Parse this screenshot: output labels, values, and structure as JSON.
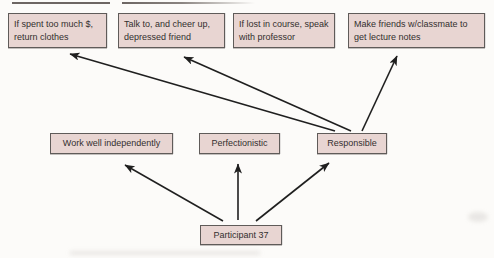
{
  "figure": {
    "participant": {
      "label": "Participant 37"
    },
    "traits": [
      {
        "label": "Work well independently"
      },
      {
        "label": "Perfectionistic"
      },
      {
        "label": "Responsible"
      }
    ],
    "behaviors": [
      {
        "label": "If spent too much $, return clothes"
      },
      {
        "label": "Talk to, and cheer up, depressed friend"
      },
      {
        "label": "If lost in course, speak with professor"
      },
      {
        "label": "Make friends w/classmate to get lecture notes"
      }
    ],
    "edges": [
      {
        "from": "Participant 37",
        "to": "Work well independently"
      },
      {
        "from": "Participant 37",
        "to": "Perfectionistic"
      },
      {
        "from": "Participant 37",
        "to": "Responsible"
      },
      {
        "from": "Responsible",
        "to": "If spent too much $, return clothes"
      },
      {
        "from": "Responsible",
        "to": "Talk to, and cheer up, depressed friend"
      },
      {
        "from": "Responsible",
        "to": "Make friends w/classmate to get lecture notes"
      }
    ],
    "colors": {
      "box_fill": "#e8d5d2",
      "box_border": "#5f5b59",
      "arrow": "#1f1f1f",
      "text": "#332f2e",
      "background": "#fcfbf9"
    }
  }
}
